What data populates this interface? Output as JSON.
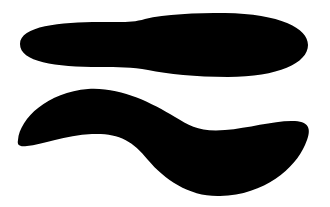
{
  "canvas": {
    "width": 330,
    "height": 207,
    "background": "#ffffff"
  },
  "shapes": [
    {
      "name": "elongated blob",
      "fill": "#000000",
      "path": "M 20 44 C 20 26, 60 22, 100 22 C 120 22, 132 23, 145 19 C 165 14, 195 13, 225 13 C 280 14, 308 28, 308 45 C 308 63, 278 77, 228 77 C 195 77, 168 74, 148 70 C 132 67, 118 67, 100 67 C 55 67, 20 62, 20 44 Z"
    },
    {
      "name": "wavy stroke",
      "fill": "#000000",
      "path": "M 18 140 C 20 118, 48 92, 88 89 C 120 87, 150 102, 175 117 C 190 126, 200 132, 225 130 C 250 128, 275 120, 295 121 C 310 122, 312 130, 305 145 C 295 168, 265 195, 220 196 C 190 197, 165 180, 148 160 C 132 140, 118 133, 92 134 C 65 135, 42 145, 27 146 C 19 147, 17 145, 18 140 Z"
    }
  ]
}
